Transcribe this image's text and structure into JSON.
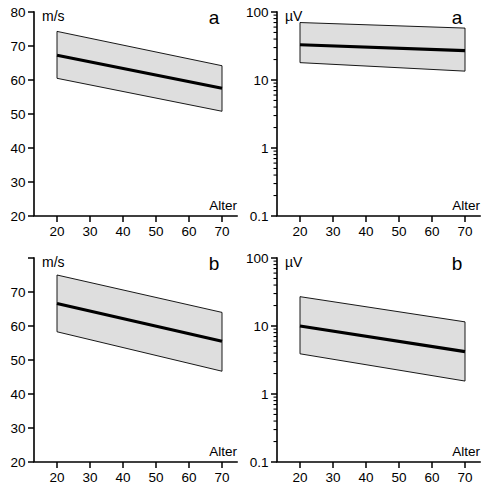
{
  "figure": {
    "panels": [
      {
        "id": "top-left",
        "letter": "a",
        "unit": "m/s",
        "xlabel": "Alter",
        "y_scale": "linear",
        "y_ticks": [
          "80",
          "70",
          "60",
          "50",
          "40",
          "30",
          "20"
        ],
        "y_tick_values": [
          80,
          70,
          60,
          50,
          40,
          30,
          20
        ],
        "x_ticks": [
          "20",
          "30",
          "40",
          "50",
          "60",
          "70"
        ],
        "x_tick_values": [
          20,
          30,
          40,
          50,
          60,
          70
        ]
      },
      {
        "id": "top-right",
        "letter": "a",
        "unit": "µV",
        "xlabel": "Alter",
        "y_scale": "log",
        "y_ticks": [
          "100",
          "10",
          "1",
          "0.1"
        ],
        "y_tick_values": [
          100,
          10,
          1,
          0.1
        ],
        "x_ticks": [
          "20",
          "30",
          "40",
          "50",
          "60",
          "70"
        ],
        "x_tick_values": [
          20,
          30,
          40,
          50,
          60,
          70
        ]
      },
      {
        "id": "bottom-left",
        "letter": "b",
        "unit": "m/s",
        "xlabel": "Alter",
        "y_scale": "linear",
        "y_ticks": [
          "",
          "70",
          "60",
          "50",
          "40",
          "30",
          "20"
        ],
        "y_tick_values": [
          80,
          70,
          60,
          50,
          40,
          30,
          20
        ],
        "x_ticks": [
          "20",
          "30",
          "40",
          "50",
          "60",
          "70"
        ],
        "x_tick_values": [
          20,
          30,
          40,
          50,
          60,
          70
        ]
      },
      {
        "id": "bottom-right",
        "letter": "b",
        "unit": "µV",
        "xlabel": "Alter",
        "y_scale": "log",
        "y_ticks": [
          "100",
          "10",
          "1",
          "0.1"
        ],
        "y_tick_values": [
          100,
          10,
          1,
          0.1
        ],
        "x_ticks": [
          "20",
          "30",
          "40",
          "50",
          "60",
          "70"
        ],
        "x_tick_values": [
          20,
          30,
          40,
          50,
          60,
          70
        ]
      }
    ]
  },
  "chart_data": [
    {
      "type": "line",
      "id": "top-left",
      "title": "a",
      "xlabel": "Alter",
      "ylabel": "m/s",
      "yscale": "linear",
      "xlim": [
        20,
        70
      ],
      "ylim": [
        20,
        80
      ],
      "grid": false,
      "legend": "none",
      "x": [
        20,
        70
      ],
      "series": [
        {
          "name": "regression",
          "values": [
            67.3,
            57.6
          ]
        },
        {
          "name": "upper-confidence-bound",
          "values": [
            74.3,
            64.2
          ]
        },
        {
          "name": "lower-confidence-bound",
          "values": [
            60.5,
            50.8
          ]
        }
      ],
      "band_color": "#dedede"
    },
    {
      "type": "line",
      "id": "top-right",
      "title": "a",
      "xlabel": "Alter",
      "ylabel": "µV",
      "yscale": "log",
      "xlim": [
        20,
        70
      ],
      "ylim": [
        0.1,
        100
      ],
      "grid": false,
      "legend": "none",
      "x": [
        20,
        70
      ],
      "series": [
        {
          "name": "regression",
          "values": [
            33.0,
            27.0
          ]
        },
        {
          "name": "upper-confidence-bound",
          "values": [
            70.0,
            58.0
          ]
        },
        {
          "name": "lower-confidence-bound",
          "values": [
            18.0,
            13.5
          ]
        }
      ],
      "band_color": "#dedede"
    },
    {
      "type": "line",
      "id": "bottom-left",
      "title": "b",
      "xlabel": "Alter",
      "ylabel": "m/s",
      "yscale": "linear",
      "xlim": [
        20,
        70
      ],
      "ylim": [
        20,
        80
      ],
      "grid": false,
      "legend": "none",
      "x": [
        20,
        70
      ],
      "series": [
        {
          "name": "regression",
          "values": [
            66.6,
            55.5
          ]
        },
        {
          "name": "upper-confidence-bound",
          "values": [
            75.0,
            64.0
          ]
        },
        {
          "name": "lower-confidence-bound",
          "values": [
            58.3,
            46.7
          ]
        }
      ],
      "band_color": "#dedede"
    },
    {
      "type": "line",
      "id": "bottom-right",
      "title": "b",
      "xlabel": "Alter",
      "ylabel": "µV",
      "yscale": "log",
      "xlim": [
        20,
        70
      ],
      "ylim": [
        0.1,
        100
      ],
      "grid": false,
      "legend": "none",
      "x": [
        20,
        70
      ],
      "series": [
        {
          "name": "regression",
          "values": [
            10.0,
            4.2
          ]
        },
        {
          "name": "upper-confidence-bound",
          "values": [
            27.0,
            11.5
          ]
        },
        {
          "name": "lower-confidence-bound",
          "values": [
            3.9,
            1.55
          ]
        }
      ],
      "band_color": "#dedede"
    }
  ]
}
